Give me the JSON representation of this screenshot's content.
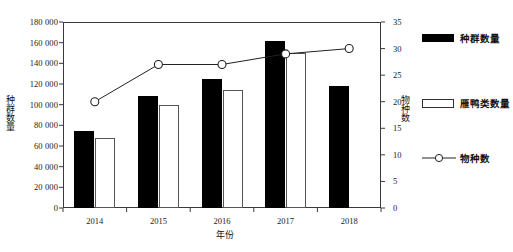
{
  "chart_data": {
    "type": "bar",
    "title": "",
    "subtitle": "",
    "xlabel": "年份",
    "ylabel": "种群数量",
    "y2label": "物种数",
    "categories": [
      "2014",
      "2015",
      "2016",
      "2017",
      "2018"
    ],
    "ylim": [
      0,
      180000
    ],
    "yticks": [
      "0",
      "20 000",
      "40 000",
      "60 000",
      "80 000",
      "100 000",
      "120 000",
      "140 000",
      "160 000",
      "180 000"
    ],
    "ytick_values": [
      0,
      20000,
      40000,
      60000,
      80000,
      100000,
      120000,
      140000,
      160000,
      180000
    ],
    "y2lim": [
      0,
      35
    ],
    "y2ticks": [
      "0",
      "5",
      "10",
      "15",
      "20",
      "25",
      "30",
      "35"
    ],
    "y2tick_values": [
      0,
      5,
      10,
      15,
      20,
      25,
      30,
      35
    ],
    "grid": false,
    "legend_position": "right",
    "series": [
      {
        "name": "种群数量",
        "kind": "bar",
        "axis": "left",
        "style": "filled-black",
        "values": [
          75000,
          108000,
          125000,
          162000,
          118000
        ]
      },
      {
        "name": "雁鸭类数量",
        "kind": "bar",
        "axis": "left",
        "style": "hollow-white",
        "values": [
          68000,
          100000,
          114000,
          150000,
          null
        ]
      },
      {
        "name": "物种数",
        "kind": "line",
        "axis": "right",
        "style": "open-circle-marker",
        "values": [
          20,
          27,
          27,
          29,
          30
        ]
      }
    ]
  },
  "legend": {
    "items": [
      {
        "label": "种群数量",
        "marker": "filled-bar-swatch"
      },
      {
        "label": "雁鸭类数量",
        "marker": "hollow-bar-swatch"
      },
      {
        "label": "物种数",
        "marker": "line-with-open-circle"
      }
    ]
  },
  "colors": {
    "bar_dark": "#000000",
    "bar_light": "#ffffff",
    "bar_light_stroke": "#555555",
    "axis": "#3a3a3a",
    "line": "#222222",
    "background": "#ffffff"
  }
}
